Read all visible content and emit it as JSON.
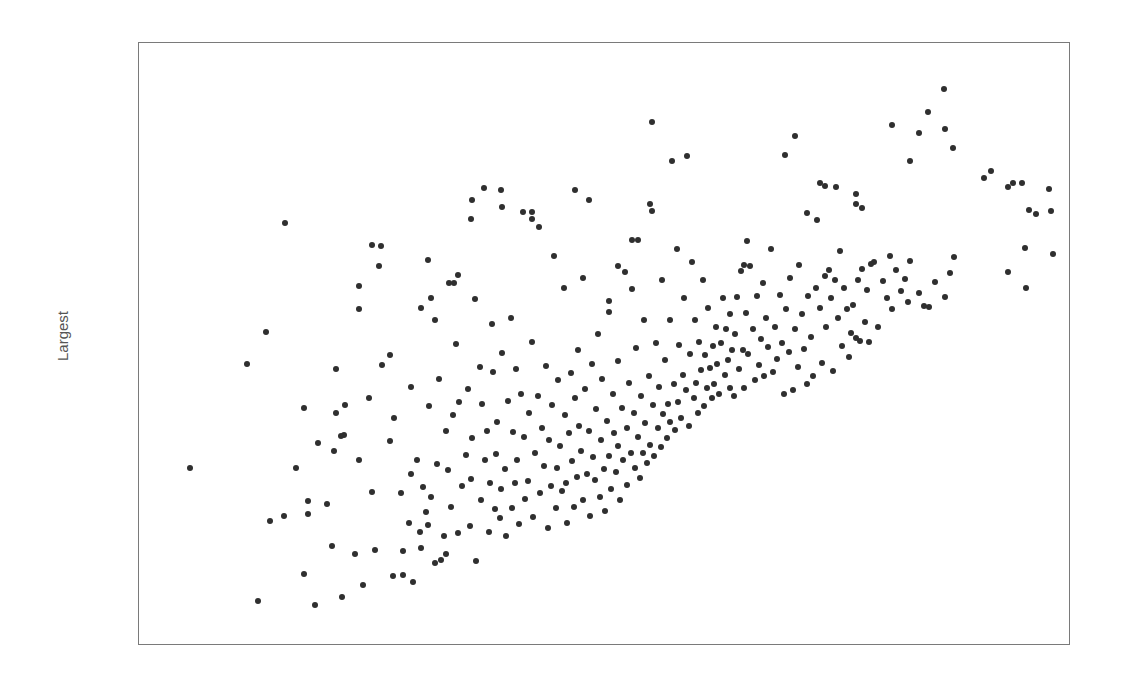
{
  "chart_data": {
    "type": "scatter",
    "title": "",
    "xlabel": "",
    "ylabel": "Largest",
    "xlim": [
      0,
      1
    ],
    "ylim": [
      0,
      1
    ],
    "grid": false,
    "legend": null,
    "x_ticks": [],
    "y_ticks": [],
    "note": "No tick labels shown; x/y are normalized positions within the plot box (0=left/bottom, 1=right/top).",
    "marker_color": "#2f2f2f",
    "points": [
      [
        0.037,
        0.282
      ],
      [
        0.113,
        0.048
      ],
      [
        0.101,
        0.466
      ],
      [
        0.122,
        0.522
      ],
      [
        0.126,
        0.189
      ],
      [
        0.143,
        0.715
      ],
      [
        0.164,
        0.095
      ],
      [
        0.176,
        0.041
      ],
      [
        0.164,
        0.388
      ],
      [
        0.169,
        0.224
      ],
      [
        0.168,
        0.201
      ],
      [
        0.19,
        0.219
      ],
      [
        0.195,
        0.145
      ],
      [
        0.197,
        0.313
      ],
      [
        0.206,
        0.055
      ],
      [
        0.209,
        0.341
      ],
      [
        0.21,
        0.394
      ],
      [
        0.221,
        0.131
      ],
      [
        0.225,
        0.604
      ],
      [
        0.225,
        0.562
      ],
      [
        0.226,
        0.296
      ],
      [
        0.23,
        0.075
      ],
      [
        0.24,
        0.676
      ],
      [
        0.237,
        0.405
      ],
      [
        0.24,
        0.24
      ],
      [
        0.243,
        0.138
      ],
      [
        0.251,
        0.463
      ],
      [
        0.26,
        0.481
      ],
      [
        0.26,
        0.33
      ],
      [
        0.263,
        0.091
      ],
      [
        0.264,
        0.371
      ],
      [
        0.272,
        0.238
      ],
      [
        0.275,
        0.135
      ],
      [
        0.275,
        0.094
      ],
      [
        0.281,
        0.186
      ],
      [
        0.283,
        0.271
      ],
      [
        0.283,
        0.425
      ],
      [
        0.286,
        0.082
      ],
      [
        0.29,
        0.297
      ],
      [
        0.293,
        0.17
      ],
      [
        0.295,
        0.141
      ],
      [
        0.297,
        0.249
      ],
      [
        0.3,
        0.205
      ],
      [
        0.302,
        0.181
      ],
      [
        0.304,
        0.391
      ],
      [
        0.306,
        0.231
      ],
      [
        0.31,
        0.115
      ],
      [
        0.312,
        0.289
      ],
      [
        0.315,
        0.44
      ],
      [
        0.317,
        0.12
      ],
      [
        0.32,
        0.162
      ],
      [
        0.322,
        0.347
      ],
      [
        0.323,
        0.131
      ],
      [
        0.325,
        0.279
      ],
      [
        0.328,
        0.213
      ],
      [
        0.33,
        0.375
      ],
      [
        0.331,
        0.608
      ],
      [
        0.334,
        0.501
      ],
      [
        0.336,
        0.168
      ],
      [
        0.337,
        0.399
      ],
      [
        0.34,
        0.25
      ],
      [
        0.345,
        0.305
      ],
      [
        0.347,
        0.422
      ],
      [
        0.349,
        0.18
      ],
      [
        0.35,
        0.263
      ],
      [
        0.352,
        0.335
      ],
      [
        0.355,
        0.58
      ],
      [
        0.356,
        0.119
      ],
      [
        0.36,
        0.461
      ],
      [
        0.362,
        0.225
      ],
      [
        0.363,
        0.395
      ],
      [
        0.366,
        0.296
      ],
      [
        0.368,
        0.347
      ],
      [
        0.37,
        0.17
      ],
      [
        0.372,
        0.255
      ],
      [
        0.374,
        0.537
      ],
      [
        0.375,
        0.451
      ],
      [
        0.377,
        0.21
      ],
      [
        0.378,
        0.306
      ],
      [
        0.38,
        0.363
      ],
      [
        0.383,
        0.194
      ],
      [
        0.384,
        0.246
      ],
      [
        0.385,
        0.485
      ],
      [
        0.388,
        0.281
      ],
      [
        0.39,
        0.163
      ],
      [
        0.392,
        0.401
      ],
      [
        0.395,
        0.547
      ],
      [
        0.396,
        0.211
      ],
      [
        0.397,
        0.345
      ],
      [
        0.4,
        0.256
      ],
      [
        0.401,
        0.457
      ],
      [
        0.402,
        0.296
      ],
      [
        0.404,
        0.183
      ],
      [
        0.406,
        0.412
      ],
      [
        0.408,
        0.733
      ],
      [
        0.41,
        0.337
      ],
      [
        0.411,
        0.228
      ],
      [
        0.414,
        0.26
      ],
      [
        0.415,
        0.379
      ],
      [
        0.418,
        0.733
      ],
      [
        0.419,
        0.505
      ],
      [
        0.42,
        0.195
      ],
      [
        0.422,
        0.309
      ],
      [
        0.425,
        0.41
      ],
      [
        0.426,
        0.707
      ],
      [
        0.428,
        0.238
      ],
      [
        0.43,
        0.352
      ],
      [
        0.432,
        0.286
      ],
      [
        0.434,
        0.462
      ],
      [
        0.436,
        0.176
      ],
      [
        0.438,
        0.331
      ],
      [
        0.44,
        0.251
      ],
      [
        0.441,
        0.394
      ],
      [
        0.443,
        0.656
      ],
      [
        0.445,
        0.212
      ],
      [
        0.446,
        0.283
      ],
      [
        0.448,
        0.437
      ],
      [
        0.45,
        0.321
      ],
      [
        0.452,
        0.242
      ],
      [
        0.454,
        0.6
      ],
      [
        0.455,
        0.375
      ],
      [
        0.457,
        0.256
      ],
      [
        0.458,
        0.185
      ],
      [
        0.46,
        0.344
      ],
      [
        0.462,
        0.45
      ],
      [
        0.463,
        0.294
      ],
      [
        0.465,
        0.213
      ],
      [
        0.467,
        0.406
      ],
      [
        0.469,
        0.267
      ],
      [
        0.47,
        0.49
      ],
      [
        0.471,
        0.356
      ],
      [
        0.473,
        0.312
      ],
      [
        0.475,
        0.225
      ],
      [
        0.476,
        0.618
      ],
      [
        0.478,
        0.422
      ],
      [
        0.48,
        0.272
      ],
      [
        0.482,
        0.348
      ],
      [
        0.483,
        0.197
      ],
      [
        0.485,
        0.466
      ],
      [
        0.487,
        0.302
      ],
      [
        0.489,
        0.261
      ],
      [
        0.49,
        0.387
      ],
      [
        0.492,
        0.518
      ],
      [
        0.494,
        0.231
      ],
      [
        0.495,
        0.332
      ],
      [
        0.497,
        0.439
      ],
      [
        0.499,
        0.28
      ],
      [
        0.5,
        0.207
      ],
      [
        0.502,
        0.365
      ],
      [
        0.504,
        0.304
      ],
      [
        0.505,
        0.557
      ],
      [
        0.507,
        0.245
      ],
      [
        0.509,
        0.413
      ],
      [
        0.51,
        0.344
      ],
      [
        0.512,
        0.275
      ],
      [
        0.514,
        0.471
      ],
      [
        0.515,
        0.321
      ],
      [
        0.517,
        0.226
      ],
      [
        0.519,
        0.388
      ],
      [
        0.52,
        0.296
      ],
      [
        0.522,
        0.628
      ],
      [
        0.524,
        0.353
      ],
      [
        0.525,
        0.253
      ],
      [
        0.527,
        0.432
      ],
      [
        0.529,
        0.308
      ],
      [
        0.53,
        0.685
      ],
      [
        0.532,
        0.379
      ],
      [
        0.534,
        0.282
      ],
      [
        0.535,
        0.494
      ],
      [
        0.537,
        0.336
      ],
      [
        0.539,
        0.265
      ],
      [
        0.54,
        0.41
      ],
      [
        0.542,
        0.308
      ],
      [
        0.544,
        0.543
      ],
      [
        0.545,
        0.362
      ],
      [
        0.547,
        0.291
      ],
      [
        0.549,
        0.445
      ],
      [
        0.55,
        0.323
      ],
      [
        0.552,
        0.892
      ],
      [
        0.554,
        0.394
      ],
      [
        0.555,
        0.304
      ],
      [
        0.557,
        0.502
      ],
      [
        0.559,
        0.352
      ],
      [
        0.56,
        0.425
      ],
      [
        0.562,
        0.319
      ],
      [
        0.564,
        0.613
      ],
      [
        0.565,
        0.378
      ],
      [
        0.567,
        0.473
      ],
      [
        0.569,
        0.335
      ],
      [
        0.57,
        0.395
      ],
      [
        0.572,
        0.544
      ],
      [
        0.573,
        0.364
      ],
      [
        0.575,
        0.823
      ],
      [
        0.577,
        0.43
      ],
      [
        0.578,
        0.349
      ],
      [
        0.58,
        0.669
      ],
      [
        0.582,
        0.399
      ],
      [
        0.583,
        0.5
      ],
      [
        0.585,
        0.371
      ],
      [
        0.587,
        0.447
      ],
      [
        0.588,
        0.582
      ],
      [
        0.59,
        0.42
      ],
      [
        0.592,
        0.832
      ],
      [
        0.594,
        0.357
      ],
      [
        0.595,
        0.484
      ],
      [
        0.597,
        0.645
      ],
      [
        0.599,
        0.405
      ],
      [
        0.6,
        0.543
      ],
      [
        0.602,
        0.432
      ],
      [
        0.604,
        0.38
      ],
      [
        0.605,
        0.505
      ],
      [
        0.607,
        0.455
      ],
      [
        0.609,
        0.614
      ],
      [
        0.61,
        0.392
      ],
      [
        0.612,
        0.481
      ],
      [
        0.614,
        0.423
      ],
      [
        0.615,
        0.565
      ],
      [
        0.617,
        0.458
      ],
      [
        0.619,
        0.406
      ],
      [
        0.62,
        0.497
      ],
      [
        0.622,
        0.43
      ],
      [
        0.624,
        0.531
      ],
      [
        0.625,
        0.465
      ],
      [
        0.627,
        0.412
      ],
      [
        0.63,
        0.502
      ],
      [
        0.632,
        0.582
      ],
      [
        0.634,
        0.446
      ],
      [
        0.635,
        0.527
      ],
      [
        0.637,
        0.473
      ],
      [
        0.639,
        0.423
      ],
      [
        0.64,
        0.553
      ],
      [
        0.642,
        0.49
      ],
      [
        0.644,
        0.41
      ],
      [
        0.645,
        0.518
      ],
      [
        0.647,
        0.584
      ],
      [
        0.65,
        0.456
      ],
      [
        0.652,
        0.63
      ],
      [
        0.654,
        0.49
      ],
      [
        0.655,
        0.424
      ],
      [
        0.657,
        0.556
      ],
      [
        0.66,
        0.483
      ],
      [
        0.662,
        0.638
      ],
      [
        0.665,
        0.527
      ],
      [
        0.667,
        0.438
      ],
      [
        0.67,
        0.585
      ],
      [
        0.672,
        0.464
      ],
      [
        0.674,
        0.51
      ],
      [
        0.676,
        0.608
      ],
      [
        0.678,
        0.445
      ],
      [
        0.68,
        0.547
      ],
      [
        0.682,
        0.495
      ],
      [
        0.685,
        0.669
      ],
      [
        0.687,
        0.452
      ],
      [
        0.69,
        0.53
      ],
      [
        0.692,
        0.474
      ],
      [
        0.695,
        0.588
      ],
      [
        0.697,
        0.503
      ],
      [
        0.7,
        0.413
      ],
      [
        0.702,
        0.562
      ],
      [
        0.705,
        0.486
      ],
      [
        0.707,
        0.617
      ],
      [
        0.71,
        0.42
      ],
      [
        0.712,
        0.528
      ],
      [
        0.715,
        0.46
      ],
      [
        0.717,
        0.64
      ],
      [
        0.72,
        0.554
      ],
      [
        0.722,
        0.492
      ],
      [
        0.725,
        0.43
      ],
      [
        0.727,
        0.585
      ],
      [
        0.73,
        0.513
      ],
      [
        0.732,
        0.445
      ],
      [
        0.735,
        0.599
      ],
      [
        0.737,
        0.72
      ],
      [
        0.74,
        0.564
      ],
      [
        0.742,
        0.468
      ],
      [
        0.745,
        0.62
      ],
      [
        0.747,
        0.53
      ],
      [
        0.75,
        0.632
      ],
      [
        0.752,
        0.582
      ],
      [
        0.755,
        0.453
      ],
      [
        0.757,
        0.613
      ],
      [
        0.76,
        0.546
      ],
      [
        0.762,
        0.665
      ],
      [
        0.765,
        0.498
      ],
      [
        0.767,
        0.6
      ],
      [
        0.77,
        0.562
      ],
      [
        0.772,
        0.478
      ],
      [
        0.775,
        0.52
      ],
      [
        0.777,
        0.57
      ],
      [
        0.78,
        0.512
      ],
      [
        0.782,
        0.614
      ],
      [
        0.785,
        0.506
      ],
      [
        0.787,
        0.633
      ],
      [
        0.79,
        0.54
      ],
      [
        0.792,
        0.596
      ],
      [
        0.795,
        0.505
      ],
      [
        0.78,
        0.765
      ],
      [
        0.78,
        0.748
      ],
      [
        0.787,
        0.74
      ],
      [
        0.701,
        0.835
      ],
      [
        0.712,
        0.868
      ],
      [
        0.8,
        0.645
      ],
      [
        0.805,
        0.53
      ],
      [
        0.81,
        0.612
      ],
      [
        0.815,
        0.582
      ],
      [
        0.818,
        0.656
      ],
      [
        0.82,
        0.563
      ],
      [
        0.825,
        0.631
      ],
      [
        0.83,
        0.594
      ],
      [
        0.835,
        0.615
      ],
      [
        0.838,
        0.575
      ],
      [
        0.84,
        0.648
      ],
      [
        0.85,
        0.59
      ],
      [
        0.856,
        0.568
      ],
      [
        0.862,
        0.567
      ],
      [
        0.797,
        0.642
      ],
      [
        0.74,
        0.785
      ],
      [
        0.745,
        0.779
      ],
      [
        0.725,
        0.732
      ],
      [
        0.758,
        0.777
      ],
      [
        0.85,
        0.873
      ],
      [
        0.82,
        0.887
      ],
      [
        0.86,
        0.91
      ],
      [
        0.878,
        0.95
      ],
      [
        0.84,
        0.823
      ],
      [
        0.88,
        0.88
      ],
      [
        0.888,
        0.847
      ],
      [
        0.931,
        0.806
      ],
      [
        0.88,
        0.584
      ],
      [
        0.89,
        0.655
      ],
      [
        0.95,
        0.777
      ],
      [
        0.923,
        0.794
      ],
      [
        0.955,
        0.785
      ],
      [
        0.965,
        0.785
      ],
      [
        0.969,
        0.67
      ],
      [
        0.996,
        0.775
      ],
      [
        0.981,
        0.73
      ],
      [
        0.973,
        0.737
      ],
      [
        0.998,
        0.735
      ],
      [
        1.0,
        0.659
      ],
      [
        0.95,
        0.628
      ],
      [
        0.97,
        0.6
      ],
      [
        0.885,
        0.626
      ],
      [
        0.868,
        0.61
      ],
      [
        0.658,
        0.682
      ],
      [
        0.655,
        0.64
      ],
      [
        0.55,
        0.748
      ],
      [
        0.537,
        0.684
      ],
      [
        0.552,
        0.735
      ],
      [
        0.53,
        0.598
      ],
      [
        0.515,
        0.638
      ],
      [
        0.504,
        0.577
      ],
      [
        0.482,
        0.755
      ],
      [
        0.466,
        0.773
      ],
      [
        0.418,
        0.722
      ],
      [
        0.365,
        0.776
      ],
      [
        0.352,
        0.755
      ],
      [
        0.384,
        0.772
      ],
      [
        0.385,
        0.742
      ],
      [
        0.35,
        0.722
      ],
      [
        0.303,
        0.649
      ],
      [
        0.306,
        0.582
      ],
      [
        0.326,
        0.608
      ],
      [
        0.248,
        0.638
      ],
      [
        0.25,
        0.673
      ],
      [
        0.336,
        0.622
      ],
      [
        0.31,
        0.543
      ],
      [
        0.295,
        0.564
      ],
      [
        0.2,
        0.38
      ],
      [
        0.2,
        0.456
      ],
      [
        0.205,
        0.338
      ],
      [
        0.18,
        0.327
      ],
      [
        0.142,
        0.198
      ],
      [
        0.155,
        0.283
      ]
    ]
  }
}
